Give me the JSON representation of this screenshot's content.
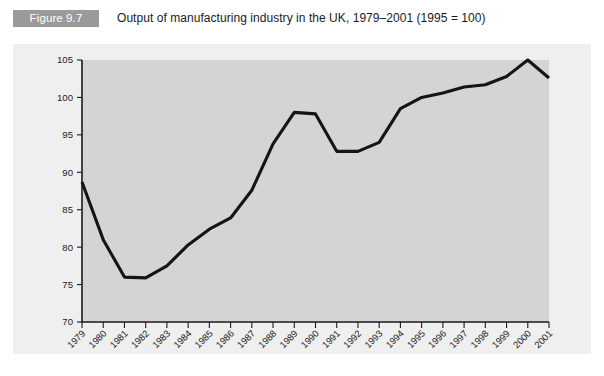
{
  "figure": {
    "badge_label": "Figure 9.7",
    "caption": "Output of manufacturing industry in the UK, 1979–2001 (1995 = 100)",
    "badge_color": "#9a9a9a",
    "panel_color": "#efefef",
    "plot_color": "#d4d4d4",
    "line_color": "#141414"
  },
  "chart_data": {
    "type": "line",
    "title": "Output of manufacturing industry in the UK, 1979–2001 (1995 = 100)",
    "xlabel": "",
    "ylabel": "",
    "ylim": [
      70,
      105
    ],
    "yticks": [
      70,
      75,
      80,
      85,
      90,
      95,
      100,
      105
    ],
    "grid": false,
    "legend": null,
    "categories": [
      "1979",
      "1980",
      "1981",
      "1982",
      "1983",
      "1984",
      "1985",
      "1986",
      "1987",
      "1988",
      "1989",
      "1990",
      "1991",
      "1992",
      "1993",
      "1994",
      "1995",
      "1996",
      "1997",
      "1998",
      "1999",
      "2000",
      "2001"
    ],
    "values": [
      88.7,
      81.0,
      76.0,
      75.9,
      77.5,
      80.3,
      82.4,
      83.9,
      87.6,
      93.8,
      98.0,
      97.8,
      92.8,
      92.8,
      94.0,
      98.5,
      100.0,
      100.6,
      101.4,
      101.7,
      102.8,
      105.0,
      102.6
    ],
    "series": [
      {
        "name": "Manufacturing output index",
        "values": [
          88.7,
          81.0,
          76.0,
          75.9,
          77.5,
          80.3,
          82.4,
          83.9,
          87.6,
          93.8,
          98.0,
          97.8,
          92.8,
          92.8,
          94.0,
          98.5,
          100.0,
          100.6,
          101.4,
          101.7,
          102.8,
          105.0,
          102.6
        ]
      }
    ]
  }
}
